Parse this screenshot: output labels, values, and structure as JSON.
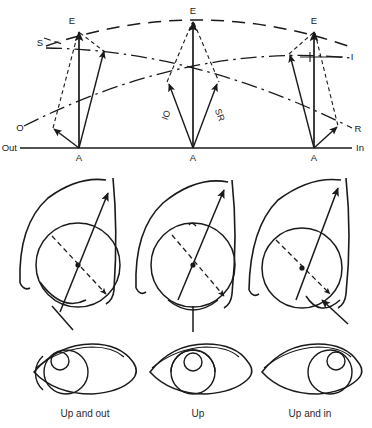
{
  "figure": {
    "background_color": "#ffffff",
    "line_color": "#1a1a1a"
  },
  "vector_diagram": {
    "axis": {
      "left_label": "Out",
      "right_label": "In",
      "baseline_y": 148,
      "baseline_x_start": 20,
      "baseline_x_end": 352
    },
    "groups": [
      {
        "name": "abduction-group",
        "gaze": "Out",
        "apex_label": "A",
        "apex_x": 79,
        "apex_y": 148,
        "elevation_label": "E",
        "elevation_x": 79,
        "elevation_y": 28,
        "side_labels": [
          {
            "text": "S",
            "x": 46,
            "y": 41
          },
          {
            "text": "O",
            "x": 24,
            "y": 128
          }
        ]
      },
      {
        "name": "primary-position-group",
        "gaze": "Primary",
        "apex_label": "A",
        "apex_x": 193,
        "apex_y": 148,
        "elevation_label": "E",
        "elevation_x": 193,
        "elevation_y": 18,
        "muscle_labels": [
          {
            "text": "IO",
            "x": 169,
            "y": 116
          },
          {
            "text": "SR",
            "x": 215,
            "y": 116
          }
        ]
      },
      {
        "name": "adduction-group",
        "gaze": "In",
        "apex_label": "A",
        "apex_x": 314,
        "apex_y": 148,
        "elevation_label": "E",
        "elevation_x": 314,
        "elevation_y": 28,
        "side_labels": [
          {
            "text": "I",
            "x": 350,
            "y": 57
          },
          {
            "text": "R",
            "x": 354,
            "y": 129
          }
        ]
      }
    ],
    "legend_keys": [
      {
        "key": "E",
        "meaning": "Elevation"
      },
      {
        "key": "A",
        "meaning": "Adduction / Abduction apex"
      },
      {
        "key": "S",
        "meaning": "S"
      },
      {
        "key": "O",
        "meaning": "O"
      },
      {
        "key": "I",
        "meaning": "I"
      },
      {
        "key": "R",
        "meaning": "R"
      },
      {
        "key": "IO",
        "meaning": "IO"
      },
      {
        "key": "SR",
        "meaning": "SR"
      }
    ]
  },
  "globe_diagrams": [
    {
      "name": "globe-up-and-out",
      "center_x": 78,
      "center_y": 265,
      "radius": 42
    },
    {
      "name": "globe-up",
      "center_x": 193,
      "center_y": 265,
      "radius": 42
    },
    {
      "name": "globe-up-and-in",
      "center_x": 306,
      "center_y": 265,
      "radius": 42
    }
  ],
  "eye_panels": [
    {
      "name": "eye-up-and-out",
      "caption": "Up and out",
      "center_x": 85,
      "center_y": 370,
      "caption_x": 85,
      "caption_y": 414
    },
    {
      "name": "eye-up",
      "caption": "Up",
      "center_x": 198,
      "center_y": 370,
      "caption_x": 198,
      "caption_y": 414
    },
    {
      "name": "eye-up-and-in",
      "caption": "Up and in",
      "center_x": 310,
      "center_y": 370,
      "caption_x": 310,
      "caption_y": 414
    }
  ]
}
